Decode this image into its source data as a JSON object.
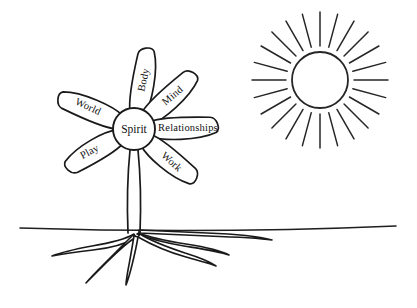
{
  "canvas": {
    "width": 417,
    "height": 308,
    "background_color": "#ffffff",
    "ink_color": "#1a1a1a",
    "style_description": "black and white line art coloring page"
  },
  "flower": {
    "center": {
      "label": "Spirit",
      "cx": 134,
      "cy": 129,
      "r": 21
    },
    "petals": [
      {
        "label": "Body",
        "angle_deg": -78,
        "length": 62,
        "half_width": 12,
        "text_rotation_deg": -78,
        "text_distance": 34
      },
      {
        "label": "Mind",
        "angle_deg": -40,
        "length": 62,
        "half_width": 12,
        "text_rotation_deg": -40,
        "text_distance": 35
      },
      {
        "label": "Relationships",
        "angle_deg": 0,
        "length": 64,
        "half_width": 12,
        "text_rotation_deg": 0,
        "text_distance": 38
      },
      {
        "label": "Work",
        "angle_deg": 42,
        "length": 60,
        "half_width": 12,
        "text_rotation_deg": 42,
        "text_distance": 34
      },
      {
        "label": "Play",
        "angle_deg": 152,
        "length": 58,
        "half_width": 12,
        "text_rotation_deg": -28,
        "text_distance": 34
      },
      {
        "label": "World",
        "angle_deg": -155,
        "length": 62,
        "half_width": 12,
        "text_rotation_deg": 25,
        "text_distance": 35
      }
    ]
  },
  "sun": {
    "name": "sun",
    "cx": 320,
    "cy": 80,
    "disc_radius": 28,
    "ray_inner_radius": 34,
    "ray_outer_radius": 68,
    "ray_count": 24,
    "stroke_color": "#262626"
  },
  "ground": {
    "name": "ground-line",
    "y": 231,
    "x_start": 20,
    "x_end": 396
  },
  "stem": {
    "name": "stem",
    "top_y": 150,
    "bottom_y": 233,
    "left_x": 128,
    "right_x": 140
  },
  "roots": {
    "name": "root-system",
    "origin_x": 134,
    "origin_y": 233,
    "branch_count": 5
  }
}
